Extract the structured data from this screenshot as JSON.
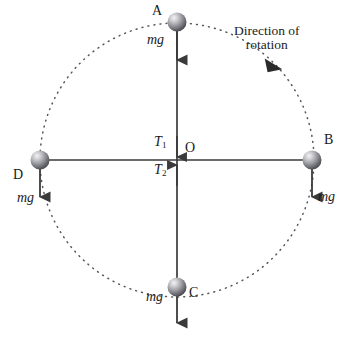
{
  "figure": {
    "background_color": "#ffffff",
    "width": 352,
    "height": 340
  },
  "colors": {
    "line": "#3a3a3a",
    "dotted_circle": "#55555a",
    "text": "#1a1a1a",
    "sphere_light": "#e8e8ea",
    "sphere_mid": "#9a9a9e",
    "sphere_dark": "#4a4a50"
  },
  "geometry": {
    "center": {
      "x": 177,
      "y": 160
    },
    "radius": 137,
    "sphere_radius": 9.5
  },
  "points": [
    {
      "id": "A",
      "label": "A",
      "cx": 177,
      "cy": 22,
      "position": "top"
    },
    {
      "id": "B",
      "label": "B",
      "cx": 312,
      "cy": 160,
      "position": "right"
    },
    {
      "id": "C",
      "label": "C",
      "cx": 177,
      "cy": 287,
      "position": "bottom"
    },
    {
      "id": "D",
      "label": "D",
      "cx": 40,
      "cy": 160,
      "position": "left"
    }
  ],
  "center_label": "O",
  "weight_label": "mg",
  "weight_vectors": [
    {
      "at": "A",
      "label": "mg"
    },
    {
      "at": "B",
      "label": "mg"
    },
    {
      "at": "C",
      "label": "mg"
    },
    {
      "at": "D",
      "label": "mg"
    }
  ],
  "tensions": [
    {
      "id": "T1",
      "symbol": "T",
      "subscript": "1",
      "direction": "down",
      "note": "tension above centre O pointing downward"
    },
    {
      "id": "T2",
      "symbol": "T",
      "subscript": "2",
      "direction": "up",
      "note": "tension below centre O pointing upward"
    }
  ],
  "rotation": {
    "label_line1": "Direction of",
    "label_line2": "rotation",
    "sense": "clockwise",
    "arrow_angle_deg": 310
  }
}
